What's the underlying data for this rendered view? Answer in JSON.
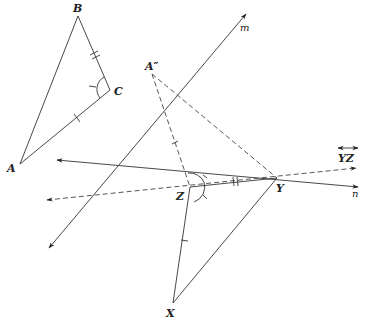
{
  "diagram": {
    "type": "geometry-reflection",
    "labels": {
      "A": "A",
      "B": "B",
      "C": "C",
      "A_double_prime": "A″",
      "X": "X",
      "Y": "Y",
      "Z": "Z",
      "line_m": "m",
      "line_n": "n",
      "line_YZ": "YZ"
    },
    "points": {
      "A": [
        20,
        164
      ],
      "B": [
        78,
        16
      ],
      "C": [
        110,
        90
      ],
      "A_double_prime": [
        152,
        74
      ],
      "X": [
        173,
        303
      ],
      "Y": [
        277,
        178
      ],
      "Z": [
        190,
        187
      ]
    },
    "lines": {
      "m": {
        "from": [
          49,
          248
        ],
        "to": [
          246,
          14
        ],
        "style": "solid",
        "arrows": "both"
      },
      "n": {
        "from": [
          57,
          160
        ],
        "to": [
          358,
          187
        ],
        "style": "solid",
        "arrows": "both"
      },
      "YZ": {
        "from": [
          47,
          200
        ],
        "to": [
          356,
          168
        ],
        "style": "dashed",
        "arrows": "both"
      }
    },
    "colors": {
      "stroke": "#333333",
      "text": "#222222",
      "background": "#ffffff"
    }
  }
}
